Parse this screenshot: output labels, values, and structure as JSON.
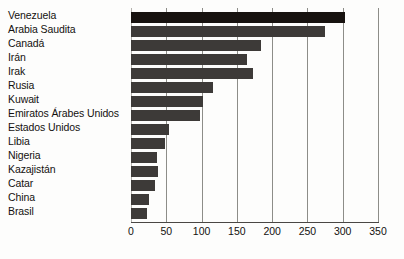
{
  "chart_data": {
    "type": "bar",
    "orientation": "horizontal",
    "title": "",
    "subtitle": "",
    "xlabel": "",
    "ylabel": "",
    "xlim": [
      0,
      350
    ],
    "xticks": [
      0,
      50,
      100,
      150,
      200,
      250,
      300,
      350
    ],
    "grid": true,
    "grid_axis": "x",
    "legend": false,
    "legend_position": "none",
    "categories": [
      "Venezuela",
      "Arabia Saudita",
      "Canadá",
      "Irán",
      "Irak",
      "Rusia",
      "Kuwait",
      "Emiratos Árabes Unidos",
      "Estados Unidos",
      "Libia",
      "Nigeria",
      "Kazajistán",
      "Catar",
      "China",
      "Brasil"
    ],
    "values": [
      303,
      275,
      184,
      164,
      173,
      116,
      102,
      98,
      54,
      48,
      37,
      38,
      34,
      25,
      22
    ],
    "bar_colors": [
      "#17120f",
      "#3d3a38",
      "#3d3a38",
      "#3d3a38",
      "#3d3a38",
      "#3d3a38",
      "#3d3a38",
      "#3d3a38",
      "#3d3a38",
      "#3d3a38",
      "#3d3a38",
      "#3d3a38",
      "#3d3a38",
      "#3d3a38",
      "#3d3a38"
    ],
    "highlight_index": 0,
    "colors": {
      "bar": "#3d3a38",
      "bar_highlight": "#17120f",
      "gridline": "#8d8d88",
      "axis": "#4a4744",
      "text": "#14110f",
      "background": "#fdfdfc"
    }
  }
}
